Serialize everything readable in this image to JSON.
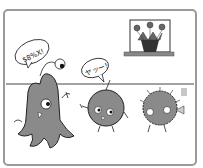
{
  "illustration": {
    "description": "Cartoon panel: a gray octopus-like creature, a round gray creature, and a spiky round creature in a room with a potted plant on a shelf",
    "speech_bubbles": [
      {
        "speaker": "octopus-creature",
        "text": "$8%X!"
      },
      {
        "speaker": "round-creature",
        "text": "ヤッー!"
      }
    ],
    "colors": {
      "frame": "#888888",
      "creature_fill": "#8a8a8a",
      "line": "#222222",
      "background": "#ffffff",
      "pot": "#333333"
    }
  }
}
